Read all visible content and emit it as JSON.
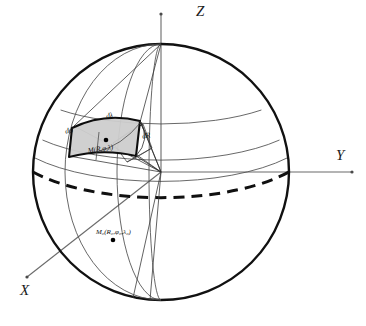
{
  "figure": {
    "type": "diagram",
    "background_color": "#ffffff",
    "stroke_color": "#1a1a1a",
    "grid_color": "#555555",
    "patch_fill_color": "#cccccc",
    "sphere": {
      "center_x": 161,
      "center_y": 172,
      "radius": 128
    }
  },
  "axes": [
    {
      "id": "z",
      "label": "Z",
      "direction": "up"
    },
    {
      "id": "y",
      "label": "Y",
      "direction": "right"
    },
    {
      "id": "x",
      "label": "X",
      "direction": "lower-left"
    }
  ],
  "differentials": [
    {
      "id": "d-lambda",
      "label": "dλ",
      "position": "top-edge-of-element"
    },
    {
      "id": "d-phi",
      "label": "dφ",
      "position": "left-edge-of-element"
    },
    {
      "id": "d-r",
      "label": "dR",
      "position": "right-edge-of-element"
    }
  ],
  "points": [
    {
      "id": "m",
      "label": "M(R,φ,λ)",
      "description": "point inside volume element"
    },
    {
      "id": "m0",
      "label_prefix": "M",
      "label_sub": "0",
      "label_rest": "(R₀,φ₀,λ₀)",
      "label": "M₀(R₀,φ₀,λ₀)",
      "description": "reference point on lower front hemisphere"
    }
  ],
  "features": [
    {
      "id": "equator",
      "style": "dashed",
      "description": "front arc of equatorial circle"
    },
    {
      "id": "meridians",
      "count": 3,
      "style": "thin"
    },
    {
      "id": "parallels",
      "count": 3,
      "style": "thin"
    },
    {
      "id": "volume-element",
      "style": "filled-grey",
      "description": "spherical volume element dR dφ dλ"
    }
  ]
}
